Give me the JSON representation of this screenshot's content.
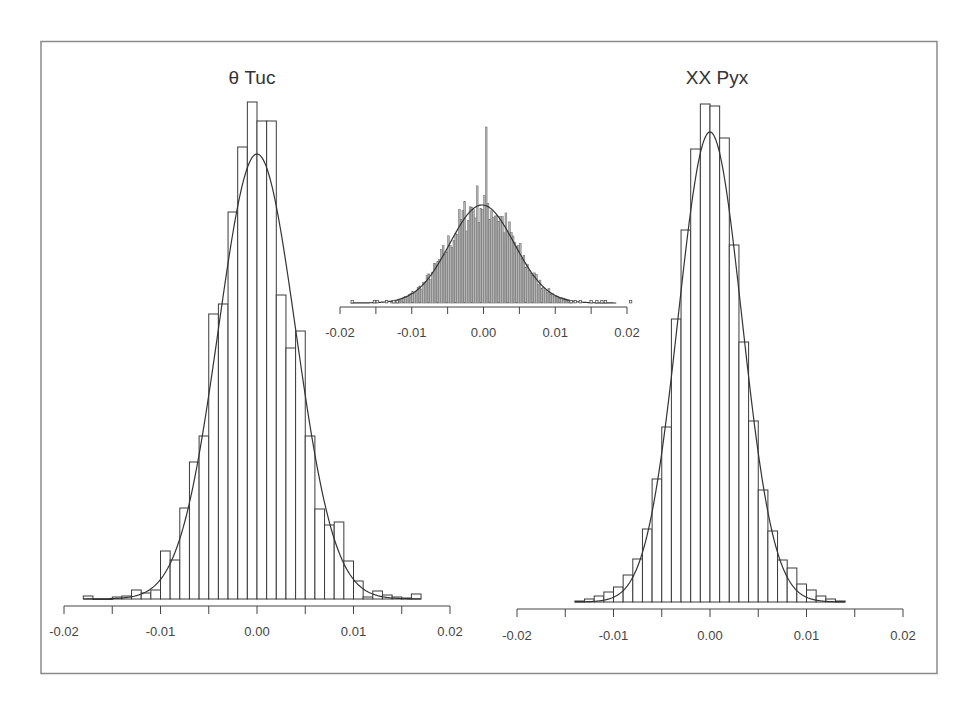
{
  "figure": {
    "background": "#ffffff",
    "frame_color": "#8a8a8a",
    "bar_stroke": "#3a3a3a",
    "inset_fill": "#b5b5b5"
  },
  "chart_data": [
    {
      "id": "left",
      "type": "bar",
      "title": "θ Tuc",
      "xlabel": "",
      "ylabel": "",
      "xlim": [
        -0.02,
        0.02
      ],
      "xticks": [
        -0.02,
        -0.015,
        -0.01,
        -0.005,
        0.0,
        0.005,
        0.01,
        0.015,
        0.02
      ],
      "xtick_labels": [
        "-0.02",
        "",
        "-0.01",
        "",
        "0.00",
        "",
        "0.01",
        "",
        "0.02"
      ],
      "grid": false,
      "y_axis_shown": false,
      "bin_width": 0.001,
      "bin_starts": [
        -0.018,
        -0.017,
        -0.016,
        -0.015,
        -0.014,
        -0.013,
        -0.012,
        -0.011,
        -0.01,
        -0.009,
        -0.008,
        -0.007,
        -0.006,
        -0.005,
        -0.004,
        -0.003,
        -0.002,
        -0.001,
        0.0,
        0.001,
        0.002,
        0.003,
        0.004,
        0.005,
        0.006,
        0.007,
        0.008,
        0.009,
        0.01,
        0.011,
        0.012,
        0.013,
        0.014,
        0.015,
        0.016
      ],
      "values": [
        3,
        0,
        0,
        2,
        3,
        9,
        6,
        9,
        48,
        39,
        91,
        137,
        163,
        285,
        295,
        387,
        452,
        497,
        478,
        478,
        304,
        251,
        268,
        163,
        90,
        74,
        77,
        38,
        18,
        2,
        8,
        4,
        2,
        1,
        5
      ],
      "fit": {
        "type": "gaussian",
        "mean": 0.0,
        "sigma": 0.004,
        "peak": 445
      },
      "value_units": "relative frequency (px-scaled)"
    },
    {
      "id": "inset",
      "type": "bar",
      "title": "",
      "xlim": [
        -0.02,
        0.02
      ],
      "xticks": [
        -0.02,
        -0.015,
        -0.01,
        -0.005,
        0.0,
        0.005,
        0.01,
        0.015,
        0.02
      ],
      "xtick_labels": [
        "-0.02",
        "",
        "-0.01",
        "",
        "0.00",
        "",
        "0.01",
        "",
        "0.02"
      ],
      "grid": false,
      "bin_width": 0.00025,
      "fit": {
        "type": "gaussian",
        "mean": -0.0002,
        "sigma": 0.0045,
        "peak": 98
      },
      "spike": {
        "x": 0.0004,
        "height": 176
      },
      "outlier_points_x": [
        -0.0183,
        -0.0152,
        -0.0148,
        -0.0135,
        -0.0125,
        -0.012,
        0.0122,
        0.0128,
        0.0135,
        0.015,
        0.0158,
        0.0165,
        0.017,
        0.0205
      ],
      "note": "fine-binned histogram with Gaussian fit and sharp central spike"
    },
    {
      "id": "right",
      "type": "bar",
      "title": "XX Pyx",
      "xlim": [
        -0.02,
        0.02
      ],
      "xticks": [
        -0.02,
        -0.015,
        -0.01,
        -0.005,
        0.0,
        0.005,
        0.01,
        0.015,
        0.02
      ],
      "xtick_labels": [
        "-0.02",
        "",
        "-0.01",
        "",
        "0.00",
        "",
        "0.01",
        "",
        "0.02"
      ],
      "grid": false,
      "y_axis_shown": false,
      "bin_width": 0.001,
      "bin_starts": [
        -0.014,
        -0.013,
        -0.012,
        -0.011,
        -0.01,
        -0.009,
        -0.008,
        -0.007,
        -0.006,
        -0.005,
        -0.004,
        -0.003,
        -0.002,
        -0.001,
        0.0,
        0.001,
        0.002,
        0.003,
        0.004,
        0.005,
        0.006,
        0.007,
        0.008,
        0.009,
        0.01,
        0.011,
        0.012,
        0.013
      ],
      "values": [
        1,
        3,
        6,
        10,
        15,
        27,
        43,
        73,
        123,
        175,
        283,
        372,
        453,
        498,
        496,
        464,
        357,
        260,
        181,
        112,
        71,
        42,
        34,
        18,
        12,
        6,
        3,
        1
      ],
      "fit": {
        "type": "gaussian",
        "mean": 0.0,
        "sigma": 0.0033,
        "peak": 470
      },
      "value_units": "relative frequency (px-scaled)"
    }
  ]
}
